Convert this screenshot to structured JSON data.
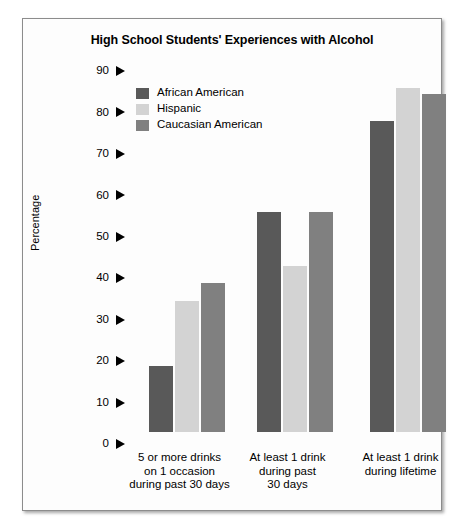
{
  "chart_data": {
    "type": "bar",
    "title": "High School Students' Experiences with Alcohol",
    "xlabel": "",
    "ylabel": "Percentage",
    "ylim": [
      0,
      90
    ],
    "yticks": [
      0,
      10,
      20,
      30,
      40,
      50,
      60,
      70,
      80,
      90
    ],
    "ytick_marker": "right-triangle",
    "grid": false,
    "legend_position": "top-left-inside",
    "categories": [
      "5 or more drinks on 1 occasion during past 30 days",
      "At least 1 drink during past 30 days",
      "At least 1 drink during lifetime"
    ],
    "category_lines": [
      [
        "5 or more drinks",
        "on 1 occasion",
        "during past 30 days"
      ],
      [
        "At least 1 drink",
        "during past",
        "30 days"
      ],
      [
        "At least 1 drink",
        "during lifetime"
      ]
    ],
    "series": [
      {
        "name": "African American",
        "color": "#595959",
        "values": [
          16,
          53,
          75
        ]
      },
      {
        "name": "Hispanic",
        "color": "#d3d3d3",
        "values": [
          31.5,
          40,
          83
        ]
      },
      {
        "name": "Caucasian American",
        "color": "#808080",
        "values": [
          36,
          53,
          81.5
        ]
      }
    ]
  }
}
